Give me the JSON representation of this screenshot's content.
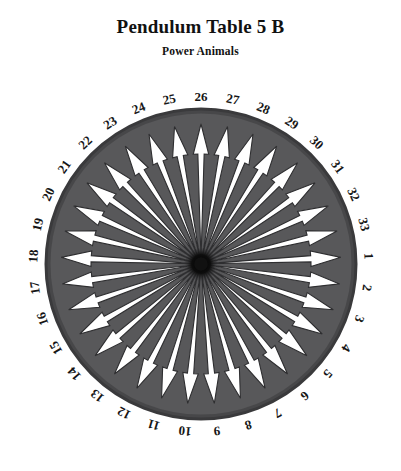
{
  "header": {
    "title": "Pendulum Table 5 B",
    "subtitle": "Power Animals"
  },
  "chart_data": {
    "type": "pie",
    "title": "Pendulum Table 5 B",
    "subtitle": "Power Animals",
    "sector_count": 33,
    "categories": [
      "1",
      "2",
      "3",
      "4",
      "5",
      "6",
      "7",
      "8",
      "9",
      "10",
      "11",
      "12",
      "13",
      "14",
      "15",
      "16",
      "17",
      "18",
      "19",
      "20",
      "21",
      "22",
      "23",
      "24",
      "25",
      "26",
      "27",
      "28",
      "29",
      "30",
      "31",
      "32",
      "33"
    ],
    "values": [
      1,
      1,
      1,
      1,
      1,
      1,
      1,
      1,
      1,
      1,
      1,
      1,
      1,
      1,
      1,
      1,
      1,
      1,
      1,
      1,
      1,
      1,
      1,
      1,
      1,
      1,
      1,
      1,
      1,
      1,
      1,
      1,
      1
    ],
    "sector_angle_degrees": 10.909,
    "direction": "clockwise",
    "top_label": "26",
    "right_label": "1",
    "bottom_label": "9",
    "left_label": "18",
    "labels_rotated_radially": true,
    "legend": "none",
    "grid": false,
    "xlabel": "",
    "ylabel": ""
  },
  "colors": {
    "disc_fill": "#58585a",
    "disc_rim": "#3a3a3c",
    "arrow_fill": "#ffffff",
    "arrow_outline": "#2e2e30",
    "hub": "#111111",
    "label_text": "#161616",
    "background": "#ffffff",
    "title_text": "#111111"
  },
  "geometry": {
    "center_x": 201,
    "center_y": 264,
    "disc_radius": 155,
    "arrow_tip_radius": 140,
    "hub_radius": 11
  }
}
